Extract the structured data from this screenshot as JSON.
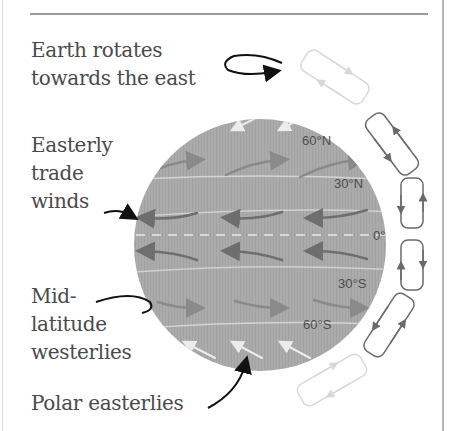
{
  "diagram": {
    "title_annotation": {
      "line1": "Earth rotates",
      "line2": "towards the east"
    },
    "labels": {
      "trade_winds": {
        "line1": "Easterly",
        "line2": "trade",
        "line3": "winds"
      },
      "westerlies": {
        "line1": "Mid-",
        "line2": "latitude",
        "line3": "westerlies"
      },
      "polar": {
        "line1": "Polar easterlies"
      }
    },
    "latitudes": {
      "n60": "60°N",
      "n30": "30°N",
      "eq": "0°",
      "s30": "30°S",
      "s60": "60°S"
    },
    "colors": {
      "globe": "#a9a9a9",
      "dark_arrow": "#6e6e6e",
      "mid_arrow": "#8a8a8a",
      "light_arrow": "#e8e8e8",
      "cell_dark": "#6a6a6a",
      "cell_light": "#d8d8d8",
      "text": "#4a4a4a"
    },
    "wind_bands": [
      {
        "band": "polar-north",
        "direction": "east-to-west",
        "shade": "light"
      },
      {
        "band": "westerlies-north",
        "direction": "west-to-east",
        "shade": "mid"
      },
      {
        "band": "trade-north",
        "direction": "east-to-west",
        "shade": "dark"
      },
      {
        "band": "trade-south",
        "direction": "east-to-west",
        "shade": "dark"
      },
      {
        "band": "westerlies-south",
        "direction": "west-to-east",
        "shade": "mid"
      },
      {
        "band": "polar-south",
        "direction": "east-to-west",
        "shade": "light"
      }
    ],
    "circulation_cells": [
      "polar-cell-north",
      "ferrel-cell-north",
      "hadley-cell-north",
      "hadley-cell-south",
      "ferrel-cell-south",
      "polar-cell-south"
    ]
  }
}
